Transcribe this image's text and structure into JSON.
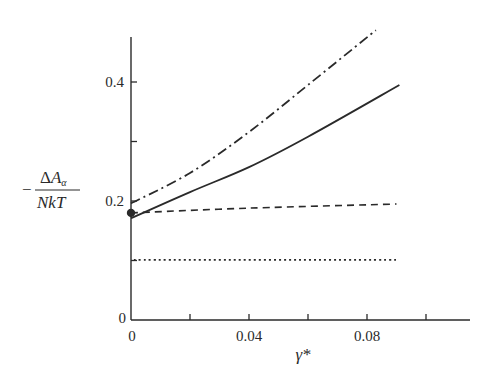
{
  "chart_data": {
    "type": "line",
    "title": "",
    "xlabel": "γ*",
    "ylabel": "−ΔA_α / NkT",
    "ylabel_parts": {
      "sign": "−",
      "numerator": "ΔA",
      "subscript": "α",
      "denominator": "NkT"
    },
    "xlim": [
      0,
      0.115
    ],
    "ylim": [
      0,
      0.475
    ],
    "x_ticks": [
      0,
      0.02,
      0.04,
      0.06,
      0.08,
      0.1
    ],
    "x_tick_labels": [
      {
        "value": 0,
        "label": "0"
      },
      {
        "value": 0.04,
        "label": "0.04"
      },
      {
        "value": 0.08,
        "label": "0.08"
      }
    ],
    "y_ticks": [
      0.1,
      0.2,
      0.3,
      0.4
    ],
    "y_tick_labels": [
      {
        "value": 0,
        "label": "0"
      },
      {
        "value": 0.2,
        "label": "0.2"
      },
      {
        "value": 0.4,
        "label": "0.4"
      }
    ],
    "grid": false,
    "legend": null,
    "series": [
      {
        "name": "dash-dot curve",
        "style": "dashdot",
        "x": [
          0,
          0.02,
          0.04,
          0.06,
          0.083
        ],
        "y": [
          0.196,
          0.247,
          0.316,
          0.395,
          0.487
        ]
      },
      {
        "name": "solid curve",
        "style": "solid",
        "x": [
          0,
          0.02,
          0.04,
          0.06,
          0.091
        ],
        "y": [
          0.171,
          0.215,
          0.257,
          0.308,
          0.395
        ]
      },
      {
        "name": "dashed line",
        "style": "dashed",
        "x": [
          0,
          0.04,
          0.09
        ],
        "y": [
          0.18,
          0.188,
          0.195
        ]
      },
      {
        "name": "dotted line",
        "style": "dotted",
        "x": [
          0.001,
          0.09
        ],
        "y": [
          0.101,
          0.101
        ]
      }
    ],
    "annotations": [
      {
        "type": "point",
        "x": 0,
        "y": 0.18,
        "marker": "filled-circle"
      }
    ],
    "colors": {
      "ink": "#2a2a2a",
      "background": "#ffffff"
    }
  }
}
